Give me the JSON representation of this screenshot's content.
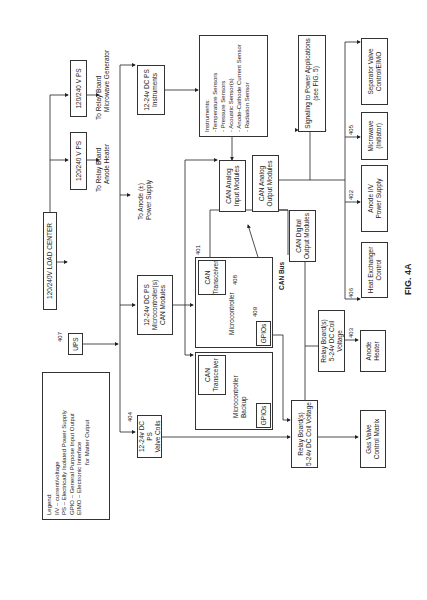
{
  "figure": {
    "number": "400",
    "caption": "FIG. 4A"
  },
  "legend": {
    "title": "Legend:",
    "lines": [
      "I/V – current/voltage",
      "PS – Electrically Isolated Power Supply",
      "GPIO – General Purpose Input Output",
      "EIMO – Electronic Interface",
      "for Matter Output"
    ]
  },
  "nodes": {
    "load_center": "120/240V LOAD CENTER",
    "ups": "UPS",
    "ps_anode_heater": "120/240 V PS",
    "ps_microwave": "120/240 V PS",
    "to_relay_anode": [
      "To Relay Board",
      "Anode Heater"
    ],
    "to_relay_microwave": [
      "To Relay Board",
      "Microwave Generator"
    ],
    "to_anode_ps": [
      "To Anode (±)",
      "Power Supply"
    ],
    "dc_ps_valve": [
      "12-24v DC PS",
      "Valve Coils"
    ],
    "dc_ps_micro": [
      "12-24v DC PS",
      "Microcontroller(s)",
      "CAN Modules"
    ],
    "dc_ps_instruments": [
      "12-24v DC PS",
      "Instruments"
    ],
    "instruments": [
      "Instruments:",
      "-Temperature Sensors",
      "- Pressure Sensors",
      "- Acoustic Sensor(s)",
      "- Anode-Cathode Current Sensor",
      "- Radiation Sensor"
    ],
    "can_analog_in": [
      "CAN Analog",
      "Input Modules"
    ],
    "can_analog_out": [
      "CAN Analog",
      "Output Modules"
    ],
    "can_digital_out": [
      "CAN Digital",
      "Output Modules"
    ],
    "can_bus": "CAN Bus",
    "micro_can": [
      "CAN",
      "Transceiver"
    ],
    "micro_label": "Microcontroller",
    "micro_gpio": "GPIOs",
    "backup_can": [
      "CAN",
      "Transceiver"
    ],
    "backup_label": [
      "Microcontroller",
      "Backup"
    ],
    "backup_gpio": "GPIOs",
    "signaling": [
      "Signaling to Power Applications",
      "(see FIG. 5)"
    ],
    "heat_exchanger": [
      "Heat Exchanger",
      "Control"
    ],
    "anode_iv": [
      "Anode I/V",
      "Power Supply"
    ],
    "microwave": [
      "Microwave",
      "(Initiator)"
    ],
    "separator": [
      "Separator Valve",
      "Control/EIMO"
    ],
    "relay_small": [
      "Relay Board(s)",
      "5-24v DC Coil Voltage"
    ],
    "anode_heater": [
      "Anode",
      "Heater"
    ],
    "relay_main": [
      "Relay Board(s)",
      "5-24v DC Coil Voltage"
    ],
    "gas_valve": [
      "Gas Valve",
      "Control Matrix"
    ]
  },
  "refs": {
    "r401": "401",
    "r402": "402",
    "r403": "403",
    "r404": "404",
    "r405": "405",
    "r406": "406",
    "r407": "407",
    "r408": "408",
    "r409": "409"
  }
}
